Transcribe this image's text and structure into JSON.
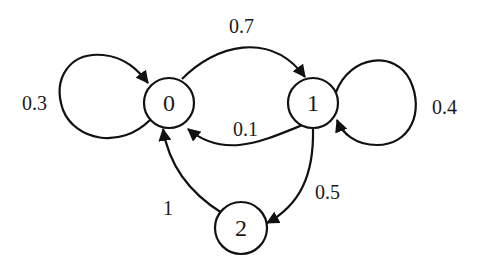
{
  "diagram": {
    "type": "markov-chain-state-diagram",
    "nodes": [
      {
        "id": "0",
        "label": "0"
      },
      {
        "id": "1",
        "label": "1"
      },
      {
        "id": "2",
        "label": "2"
      }
    ],
    "edges": [
      {
        "from": "0",
        "to": "0",
        "label": "0.3"
      },
      {
        "from": "0",
        "to": "1",
        "label": "0.7"
      },
      {
        "from": "1",
        "to": "1",
        "label": "0.4"
      },
      {
        "from": "1",
        "to": "0",
        "label": "0.1"
      },
      {
        "from": "1",
        "to": "2",
        "label": "0.5"
      },
      {
        "from": "2",
        "to": "0",
        "label": "1"
      }
    ]
  }
}
